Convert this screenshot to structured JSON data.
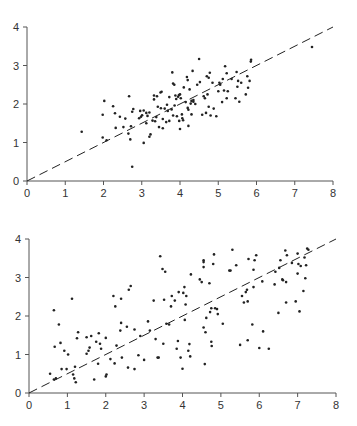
{
  "chart_data": [
    {
      "type": "scatter",
      "title": "",
      "xlabel": "",
      "ylabel": "",
      "xlim": [
        0,
        8
      ],
      "ylim": [
        0,
        4
      ],
      "xticks": [
        0,
        1,
        2,
        3,
        4,
        5,
        6,
        7,
        8
      ],
      "yticks": [
        0,
        1,
        2,
        3,
        4
      ],
      "grid": false,
      "reference_line": {
        "style": "dashed",
        "x": [
          0,
          8
        ],
        "y": [
          0,
          4
        ]
      },
      "points": [
        [
          1.43,
          1.28
        ],
        [
          1.98,
          1.72
        ],
        [
          2.02,
          2.08
        ],
        [
          1.98,
          1.13
        ],
        [
          2.08,
          1.06
        ],
        [
          2.25,
          1.94
        ],
        [
          2.3,
          1.76
        ],
        [
          2.32,
          1.38
        ],
        [
          2.43,
          1.67
        ],
        [
          2.52,
          1.4
        ],
        [
          2.57,
          1.62
        ],
        [
          2.67,
          2.2
        ],
        [
          2.65,
          1.23
        ],
        [
          2.7,
          1.08
        ],
        [
          2.72,
          1.42
        ],
        [
          2.75,
          1.8
        ],
        [
          2.78,
          1.87
        ],
        [
          2.75,
          0.37
        ],
        [
          2.93,
          1.63
        ],
        [
          2.96,
          1.82
        ],
        [
          2.98,
          1.67
        ],
        [
          3.01,
          1.71
        ],
        [
          3.05,
          1.83
        ],
        [
          3.05,
          0.99
        ],
        [
          3.12,
          1.77
        ],
        [
          3.12,
          1.5
        ],
        [
          3.15,
          1.69
        ],
        [
          3.2,
          1.78
        ],
        [
          3.2,
          1.15
        ],
        [
          3.23,
          1.21
        ],
        [
          3.28,
          1.57
        ],
        [
          3.32,
          2.22
        ],
        [
          3.32,
          2.12
        ],
        [
          3.35,
          1.55
        ],
        [
          3.38,
          1.66
        ],
        [
          3.4,
          2.2
        ],
        [
          3.42,
          1.93
        ],
        [
          3.45,
          1.4
        ],
        [
          3.49,
          2.3
        ],
        [
          3.5,
          1.89
        ],
        [
          3.52,
          2.32
        ],
        [
          3.55,
          1.37
        ],
        [
          3.55,
          1.61
        ],
        [
          3.6,
          1.88
        ],
        [
          3.64,
          1.53
        ],
        [
          3.66,
          1.98
        ],
        [
          3.68,
          1.82
        ],
        [
          3.72,
          2.18
        ],
        [
          3.72,
          1.56
        ],
        [
          3.78,
          1.86
        ],
        [
          3.8,
          2.82
        ],
        [
          3.82,
          2.53
        ],
        [
          3.82,
          1.7
        ],
        [
          3.85,
          2.5
        ],
        [
          3.86,
          1.96
        ],
        [
          3.88,
          2.22
        ],
        [
          3.9,
          2.13
        ],
        [
          3.92,
          1.68
        ],
        [
          3.95,
          2.19
        ],
        [
          3.97,
          2.23
        ],
        [
          3.98,
          1.56
        ],
        [
          4.0,
          1.35
        ],
        [
          4.0,
          2.25
        ],
        [
          4.02,
          2.15
        ],
        [
          4.05,
          1.73
        ],
        [
          4.06,
          1.63
        ],
        [
          4.08,
          1.58
        ],
        [
          4.1,
          2.43
        ],
        [
          4.15,
          2.05
        ],
        [
          4.18,
          2.7
        ],
        [
          4.2,
          2.62
        ],
        [
          4.2,
          1.9
        ],
        [
          4.22,
          1.43
        ],
        [
          4.22,
          1.85
        ],
        [
          4.25,
          2.38
        ],
        [
          4.28,
          2.01
        ],
        [
          4.3,
          1.73
        ],
        [
          4.3,
          2.08
        ],
        [
          4.33,
          2.86
        ],
        [
          4.35,
          2.06
        ],
        [
          4.35,
          2.1
        ],
        [
          4.4,
          2.0
        ],
        [
          4.45,
          2.5
        ],
        [
          4.5,
          3.17
        ],
        [
          4.52,
          2.57
        ],
        [
          4.58,
          1.72
        ],
        [
          4.62,
          2.2
        ],
        [
          4.65,
          2.15
        ],
        [
          4.68,
          1.77
        ],
        [
          4.7,
          2.72
        ],
        [
          4.72,
          2.25
        ],
        [
          4.75,
          2.68
        ],
        [
          4.75,
          1.93
        ],
        [
          4.78,
          2.81
        ],
        [
          4.8,
          1.7
        ],
        [
          4.85,
          2.55
        ],
        [
          4.88,
          1.88
        ],
        [
          4.95,
          1.68
        ],
        [
          5.0,
          2.33
        ],
        [
          5.03,
          2.55
        ],
        [
          5.05,
          2.5
        ],
        [
          5.1,
          2.05
        ],
        [
          5.12,
          2.65
        ],
        [
          5.15,
          2.35
        ],
        [
          5.18,
          2.98
        ],
        [
          5.22,
          2.8
        ],
        [
          5.22,
          2.15
        ],
        [
          5.25,
          2.33
        ],
        [
          5.35,
          2.65
        ],
        [
          5.45,
          2.15
        ],
        [
          5.48,
          2.83
        ],
        [
          5.5,
          2.45
        ],
        [
          5.52,
          2.6
        ],
        [
          5.55,
          2.06
        ],
        [
          5.6,
          2.55
        ],
        [
          5.72,
          2.25
        ],
        [
          5.76,
          2.72
        ],
        [
          5.78,
          2.42
        ],
        [
          5.82,
          2.6
        ],
        [
          5.85,
          3.1
        ],
        [
          5.86,
          3.15
        ],
        [
          7.45,
          3.48
        ]
      ]
    },
    {
      "type": "scatter",
      "title": "",
      "xlabel": "",
      "ylabel": "",
      "xlim": [
        0,
        8
      ],
      "ylim": [
        0,
        4
      ],
      "xticks": [
        0,
        1,
        2,
        3,
        4,
        5,
        6,
        7,
        8
      ],
      "yticks": [
        0,
        1,
        2,
        3,
        4
      ],
      "grid": false,
      "reference_line": {
        "style": "dashed",
        "x": [
          0,
          8
        ],
        "y": [
          0,
          4
        ]
      },
      "points": [
        [
          0.55,
          0.5
        ],
        [
          0.65,
          0.35
        ],
        [
          0.65,
          2.15
        ],
        [
          0.67,
          1.2
        ],
        [
          0.7,
          0.38
        ],
        [
          0.78,
          1.78
        ],
        [
          0.82,
          1.3
        ],
        [
          0.85,
          0.62
        ],
        [
          0.92,
          1.1
        ],
        [
          0.98,
          0.62
        ],
        [
          1.02,
          1.0
        ],
        [
          1.12,
          2.45
        ],
        [
          1.15,
          0.48
        ],
        [
          1.18,
          0.38
        ],
        [
          1.2,
          0.68
        ],
        [
          1.22,
          0.28
        ],
        [
          1.25,
          1.42
        ],
        [
          1.28,
          1.58
        ],
        [
          1.5,
          1.02
        ],
        [
          1.5,
          1.45
        ],
        [
          1.55,
          1.1
        ],
        [
          1.58,
          1.18
        ],
        [
          1.62,
          1.48
        ],
        [
          1.7,
          0.35
        ],
        [
          1.75,
          1.33
        ],
        [
          1.8,
          0.76
        ],
        [
          1.82,
          1.55
        ],
        [
          1.85,
          1.28
        ],
        [
          1.88,
          1.15
        ],
        [
          2.0,
          1.43
        ],
        [
          2.0,
          0.43
        ],
        [
          2.02,
          0.48
        ],
        [
          2.12,
          0.88
        ],
        [
          2.2,
          2.52
        ],
        [
          2.23,
          0.77
        ],
        [
          2.25,
          2.25
        ],
        [
          2.28,
          1.23
        ],
        [
          2.38,
          1.62
        ],
        [
          2.4,
          1.82
        ],
        [
          2.4,
          2.45
        ],
        [
          2.42,
          0.92
        ],
        [
          2.55,
          1.72
        ],
        [
          2.58,
          0.66
        ],
        [
          2.6,
          2.68
        ],
        [
          2.65,
          2.78
        ],
        [
          2.75,
          1.65
        ],
        [
          2.75,
          0.62
        ],
        [
          2.85,
          0.98
        ],
        [
          2.9,
          1.48
        ],
        [
          3.0,
          0.86
        ],
        [
          3.1,
          1.86
        ],
        [
          3.15,
          1.62
        ],
        [
          3.25,
          2.4
        ],
        [
          3.3,
          1.4
        ],
        [
          3.35,
          0.92
        ],
        [
          3.38,
          0.92
        ],
        [
          3.42,
          3.55
        ],
        [
          3.48,
          3.22
        ],
        [
          3.52,
          2.42
        ],
        [
          3.55,
          3.15
        ],
        [
          3.58,
          1.8
        ],
        [
          3.5,
          1.28
        ],
        [
          3.65,
          1.78
        ],
        [
          3.7,
          2.25
        ],
        [
          3.72,
          2.52
        ],
        [
          3.8,
          2.4
        ],
        [
          3.85,
          1.15
        ],
        [
          3.88,
          1.35
        ],
        [
          3.9,
          2.62
        ],
        [
          3.95,
          0.92
        ],
        [
          4.0,
          0.63
        ],
        [
          4.02,
          2.6
        ],
        [
          4.05,
          2.75
        ],
        [
          4.06,
          1.9
        ],
        [
          4.08,
          2.3
        ],
        [
          4.1,
          2.52
        ],
        [
          4.15,
          1.1
        ],
        [
          4.18,
          1.27
        ],
        [
          4.2,
          0.95
        ],
        [
          4.22,
          3.08
        ],
        [
          4.45,
          2.95
        ],
        [
          4.5,
          2.88
        ],
        [
          4.55,
          3.45
        ],
        [
          4.55,
          3.4
        ],
        [
          4.55,
          3.27
        ],
        [
          4.55,
          1.7
        ],
        [
          4.58,
          0.75
        ],
        [
          4.6,
          1.58
        ],
        [
          4.62,
          1.95
        ],
        [
          4.7,
          2.85
        ],
        [
          4.72,
          2.1
        ],
        [
          4.75,
          2.2
        ],
        [
          4.75,
          1.33
        ],
        [
          4.76,
          1.22
        ],
        [
          4.8,
          3.35
        ],
        [
          4.82,
          3.6
        ],
        [
          4.85,
          2.2
        ],
        [
          4.9,
          2.18
        ],
        [
          4.92,
          2.05
        ],
        [
          5.05,
          1.8
        ],
        [
          5.22,
          3.18
        ],
        [
          5.25,
          3.18
        ],
        [
          5.3,
          3.72
        ],
        [
          5.4,
          3.32
        ],
        [
          5.5,
          1.25
        ],
        [
          5.55,
          2.52
        ],
        [
          5.6,
          2.35
        ],
        [
          5.65,
          2.62
        ],
        [
          5.68,
          2.68
        ],
        [
          5.7,
          2.38
        ],
        [
          5.7,
          1.37
        ],
        [
          5.72,
          3.48
        ],
        [
          5.82,
          1.78
        ],
        [
          5.85,
          2.75
        ],
        [
          5.85,
          3.2
        ],
        [
          5.88,
          3.45
        ],
        [
          5.92,
          3.58
        ],
        [
          6.0,
          1.17
        ],
        [
          6.08,
          2.9
        ],
        [
          6.1,
          1.6
        ],
        [
          6.25,
          1.15
        ],
        [
          6.4,
          2.82
        ],
        [
          6.42,
          3.15
        ],
        [
          6.5,
          2.08
        ],
        [
          6.52,
          3.25
        ],
        [
          6.55,
          3.45
        ],
        [
          6.6,
          2.95
        ],
        [
          6.62,
          2.93
        ],
        [
          6.68,
          3.7
        ],
        [
          6.7,
          2.35
        ],
        [
          6.7,
          2.88
        ],
        [
          6.72,
          3.58
        ],
        [
          6.85,
          3.38
        ],
        [
          6.95,
          2.38
        ],
        [
          7.0,
          3.62
        ],
        [
          7.0,
          3.1
        ],
        [
          7.02,
          3.35
        ],
        [
          7.05,
          2.12
        ],
        [
          7.08,
          3.3
        ],
        [
          7.15,
          2.65
        ],
        [
          7.18,
          3.52
        ],
        [
          7.2,
          2.98
        ],
        [
          7.22,
          3.32
        ],
        [
          7.25,
          3.75
        ],
        [
          7.28,
          3.72
        ]
      ]
    }
  ]
}
